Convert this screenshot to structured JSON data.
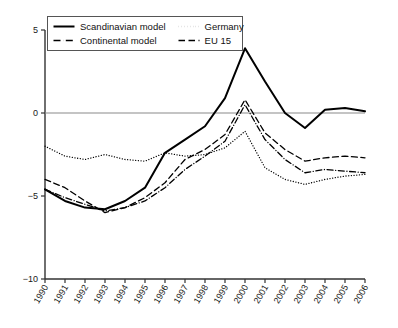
{
  "chart_data": {
    "type": "line",
    "title": "",
    "xlabel": "",
    "ylabel": "",
    "xlim": [
      1990,
      2006
    ],
    "ylim": [
      -10,
      5
    ],
    "yticks": [
      5,
      0,
      -5,
      -10
    ],
    "ytick_labels": [
      "5",
      "0",
      "−5",
      "−10"
    ],
    "grid": false,
    "zero_line": true,
    "legend_position": "top-left",
    "categories": [
      1990,
      1991,
      1992,
      1993,
      1994,
      1995,
      1996,
      1997,
      1998,
      1999,
      2000,
      2001,
      2002,
      2003,
      2004,
      2005,
      2006
    ],
    "xtick_labels": [
      "1990",
      "1991",
      "1992",
      "1993",
      "1994",
      "1995",
      "1996",
      "1997",
      "1998",
      "1999",
      "2000",
      "2001",
      "2002",
      "2003",
      "2004",
      "2005",
      "2006"
    ],
    "series": [
      {
        "name": "Scandinavian model",
        "style": "solid",
        "color": "#000000",
        "width": 2.0,
        "values": [
          -4.6,
          -5.3,
          -5.7,
          -5.8,
          -5.3,
          -4.5,
          -2.4,
          -1.6,
          -0.8,
          0.9,
          3.9,
          1.9,
          0.0,
          -0.9,
          0.2,
          0.3,
          0.1
        ]
      },
      {
        "name": "Germany",
        "style": "dotted",
        "color": "#000000",
        "width": 1.3,
        "values": [
          -2.0,
          -2.6,
          -2.8,
          -2.5,
          -2.8,
          -2.9,
          -2.4,
          -2.6,
          -2.5,
          -2.1,
          -1.1,
          -3.3,
          -4.0,
          -4.3,
          -4.0,
          -3.8,
          -3.7
        ]
      },
      {
        "name": "Continental model",
        "style": "dashdot",
        "color": "#000000",
        "width": 1.3,
        "values": [
          -4.6,
          -5.1,
          -5.5,
          -5.9,
          -5.7,
          -5.3,
          -4.5,
          -3.4,
          -2.6,
          -1.7,
          0.5,
          -1.6,
          -2.8,
          -3.6,
          -3.4,
          -3.5,
          -3.6
        ]
      },
      {
        "name": "EU 15",
        "style": "dashed",
        "color": "#000000",
        "width": 1.3,
        "values": [
          -4.0,
          -4.5,
          -5.3,
          -6.0,
          -5.7,
          -5.1,
          -4.2,
          -2.8,
          -2.2,
          -1.3,
          0.8,
          -1.2,
          -2.2,
          -2.9,
          -2.7,
          -2.6,
          -2.7
        ]
      }
    ]
  },
  "legend": {
    "entries": [
      {
        "label": "Scandinavian model",
        "style": "solid"
      },
      {
        "label": "Germany",
        "style": "dotted"
      },
      {
        "label": "Continental model",
        "style": "dashdot"
      },
      {
        "label": "EU 15",
        "style": "dashed"
      }
    ]
  },
  "axes": {
    "y_axis_color": "#333333",
    "zero_line_color": "#8a8a8a"
  }
}
